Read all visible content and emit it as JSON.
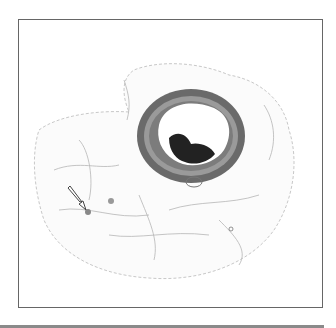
{
  "figure": {
    "type": "histology-micrograph",
    "annotation": {
      "type": "arrow",
      "target": "small round structure",
      "color": "#ffffff"
    },
    "colors": {
      "border": "#666666",
      "vessel_wall": "#555555",
      "thrombus": "#222222",
      "tissue": "#bbbbbb",
      "bottom_bar": "#8a8a8a"
    }
  }
}
